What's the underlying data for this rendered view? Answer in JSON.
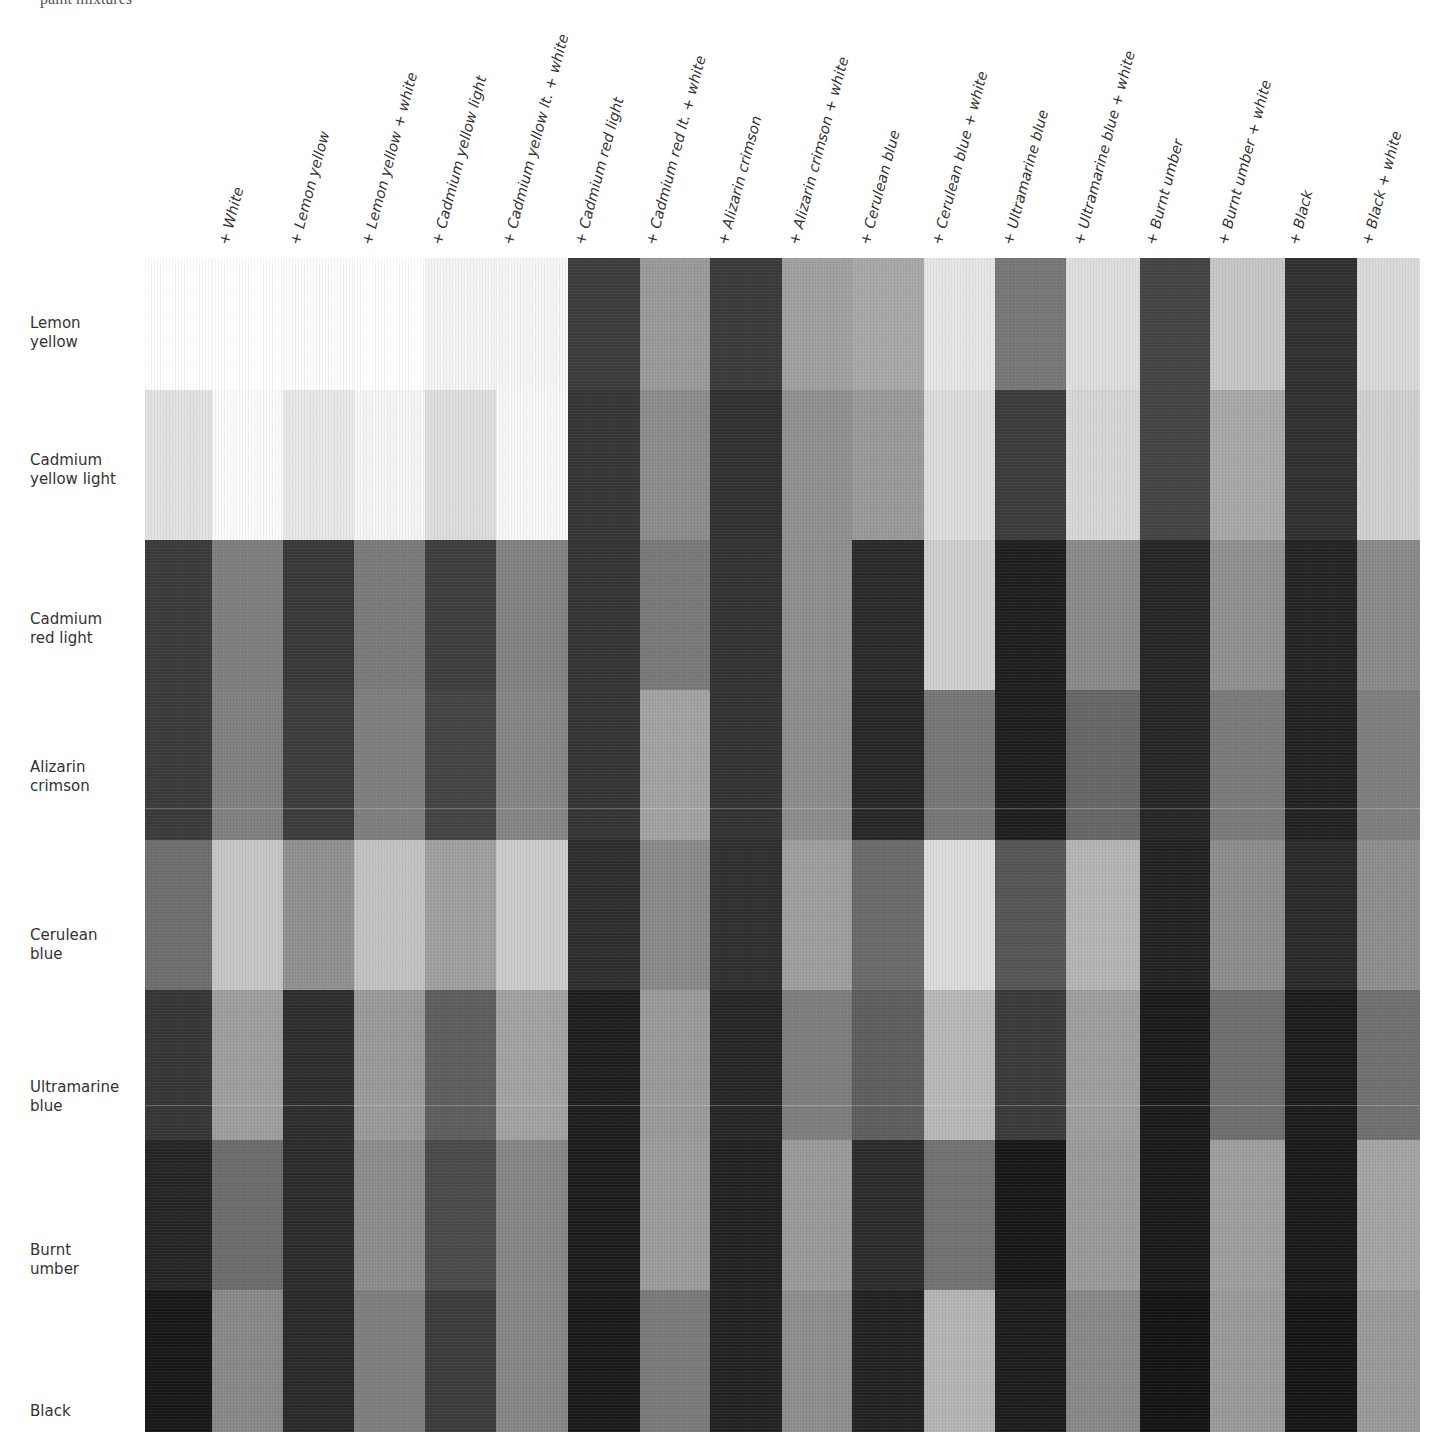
{
  "page": {
    "top_fragment": "paint mixtures"
  },
  "columns": [
    "+ White",
    "+ Lemon yellow",
    "+ Lemon yellow + white",
    "+ Cadmium yellow light",
    "+ Cadmium yellow lt. + white",
    "+ Cadmium red light",
    "+ Cadmium red lt. + white",
    "+ Alizarin crimson",
    "+ Alizarin crimson + white",
    "+ Cerulean blue",
    "+ Cerulean blue + white",
    "+ Ultramarine blue",
    "+ Ultramarine blue + white",
    "+ Burnt umber",
    "+ Burnt umber + white",
    "+ Black",
    "+ Black + white"
  ],
  "rows": [
    {
      "label": [
        "Lemon",
        "yellow"
      ]
    },
    {
      "label": [
        "Cadmium",
        "yellow light"
      ]
    },
    {
      "label": [
        "Cadmium",
        "red light"
      ]
    },
    {
      "label": [
        "Alizarin",
        "crimson"
      ]
    },
    {
      "label": [
        "Cerulean",
        "blue"
      ]
    },
    {
      "label": [
        "Ultramarine",
        "blue"
      ]
    },
    {
      "label": [
        "Burnt",
        "umber"
      ]
    },
    {
      "label": [
        "Black"
      ]
    }
  ],
  "grid": {
    "column_count": 19,
    "row_tops": [
      258,
      390,
      540,
      690,
      840,
      990,
      1140,
      1290
    ],
    "row_bottoms": [
      390,
      540,
      690,
      840,
      990,
      1140,
      1290,
      1432
    ],
    "tones": [
      [
        "#ffffff",
        "#ffffff",
        "#fdfdfd",
        "#ffffff",
        "#f4f4f4",
        "#f6f6f6",
        "#3c3c3c",
        "#9a9a9a",
        "#3a3a3a",
        "#a0a0a0",
        "#a8a8a8",
        "#e6e6e6",
        "#777777",
        "#dedede",
        "#444444",
        "#c6c6c6",
        "#303030",
        "#dadada"
      ],
      [
        "#e2e2e2",
        "#fbfbfb",
        "#e8e8e8",
        "#f6f6f6",
        "#dedede",
        "#f8f8f8",
        "#363636",
        "#8c8c8c",
        "#313131",
        "#909090",
        "#9a9a9a",
        "#dcdcdc",
        "#3c3c3c",
        "#d6d6d6",
        "#444444",
        "#a8a8a8",
        "#303030",
        "#d0d0d0"
      ],
      [
        "#3a3a3a",
        "#7e7e7e",
        "#393939",
        "#7a7a7a",
        "#3e3e3e",
        "#828282",
        "#353535",
        "#797979",
        "#333333",
        "#8e8e8e",
        "#2a2a2a",
        "#cfcfcf",
        "#1f1f1f",
        "#8a8a8a",
        "#262626",
        "#909090",
        "#242424",
        "#8a8a8a"
      ],
      [
        "#3a3a3a",
        "#808080",
        "#3c3c3c",
        "#7e7e7e",
        "#444444",
        "#858585",
        "#353535",
        "#a2a2a2",
        "#333333",
        "#8c8c8c",
        "#272727",
        "#767676",
        "#1e1e1e",
        "#666666",
        "#262626",
        "#7a7a7a",
        "#222222",
        "#7e7e7e"
      ],
      [
        "#6e6e6e",
        "#c6c6c6",
        "#909090",
        "#c2c2c2",
        "#a0a0a0",
        "#cccccc",
        "#2e2e2e",
        "#8a8a8a",
        "#2f2f2f",
        "#9e9e9e",
        "#6a6a6a",
        "#dcdcdc",
        "#555555",
        "#b4b4b4",
        "#222222",
        "#8c8c8c",
        "#2a2a2a",
        "#8e8e8e"
      ],
      [
        "#363636",
        "#9e9e9e",
        "#2e2e2e",
        "#9a9a9a",
        "#5e5e5e",
        "#a2a2a2",
        "#1e1e1e",
        "#9a9a9a",
        "#262626",
        "#7e7e7e",
        "#5e5e5e",
        "#b8b8b8",
        "#3a3a3a",
        "#9e9e9e",
        "#1b1b1b",
        "#6e6e6e",
        "#1c1c1c",
        "#707070"
      ],
      [
        "#252525",
        "#6c6c6c",
        "#2c2c2c",
        "#8c8c8c",
        "#4a4a4a",
        "#868686",
        "#1c1c1c",
        "#9c9c9c",
        "#222222",
        "#9a9a9a",
        "#2c2c2c",
        "#727272",
        "#181818",
        "#9a9a9a",
        "#1a1a1a",
        "#9e9e9e",
        "#1a1a1a",
        "#a4a4a4"
      ],
      [
        "#181818",
        "#888888",
        "#2a2a2a",
        "#7e7e7e",
        "#3c3c3c",
        "#868686",
        "#1a1a1a",
        "#7a7a7a",
        "#222222",
        "#8e8e8e",
        "#222222",
        "#b4b4b4",
        "#1d1d1d",
        "#888888",
        "#141414",
        "#9a9a9a",
        "#161616",
        "#9a9a9a"
      ]
    ],
    "column_x": [
      145,
      212,
      283,
      354,
      425,
      496,
      568,
      640,
      710,
      782,
      852,
      924,
      995,
      1066,
      1140,
      1210,
      1285,
      1357
    ],
    "column_w": [
      67,
      71,
      71,
      71,
      71,
      72,
      72,
      70,
      72,
      70,
      72,
      71,
      71,
      74,
      70,
      75,
      72,
      63
    ]
  }
}
